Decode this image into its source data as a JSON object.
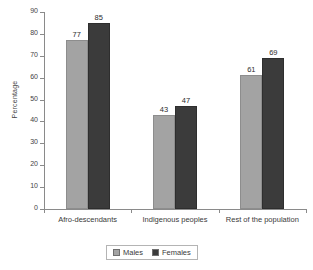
{
  "chart_data": {
    "type": "bar",
    "title": "",
    "xlabel": "",
    "ylabel": "Percentage",
    "ylim": [
      0,
      90
    ],
    "ytick_step": 10,
    "yticks": [
      0,
      10,
      20,
      30,
      40,
      50,
      60,
      70,
      80,
      90
    ],
    "grid": false,
    "legend_position": "bottom-center",
    "categories": [
      "Afro-descendants",
      "Indigenous peoples",
      "Rest of the population"
    ],
    "series": [
      {
        "name": "Males",
        "color": "#a3a3a3",
        "values": [
          77,
          43,
          61
        ]
      },
      {
        "name": "Females",
        "color": "#3b3b3b",
        "values": [
          85,
          47,
          69
        ]
      }
    ]
  },
  "axis": {
    "y_label": "Percentage",
    "y_ticks": [
      "90",
      "80",
      "70",
      "60",
      "50",
      "40",
      "30",
      "20",
      "10",
      "0"
    ]
  },
  "categories": [
    {
      "label": "Afro-descendants",
      "male": "77",
      "female": "85"
    },
    {
      "label": "Indigenous peoples",
      "male": "43",
      "female": "47"
    },
    {
      "label": "Rest of the population",
      "male": "61",
      "female": "69"
    }
  ],
  "legend": {
    "items": [
      {
        "label": "Males",
        "color": "#a3a3a3"
      },
      {
        "label": "Females",
        "color": "#3b3b3b"
      }
    ]
  },
  "colors": {
    "male_bar": "#a3a3a3",
    "female_bar": "#3b3b3b",
    "axis": "#8a8a8a",
    "text": "#3a3a3a",
    "background": "#ffffff"
  }
}
